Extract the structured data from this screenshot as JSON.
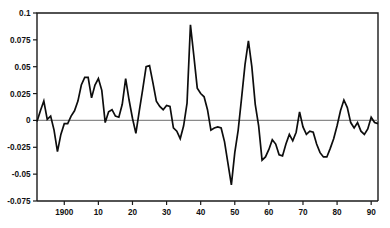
{
  "chart_data": {
    "type": "line",
    "title": "",
    "xlabel": "",
    "ylabel": "",
    "xlim": [
      1892,
      1992
    ],
    "ylim": [
      -0.075,
      0.1
    ],
    "grid": false,
    "legend": null,
    "zero_line": true,
    "y_ticks": [
      "0.1",
      "0.075",
      "0.05",
      "0.025",
      "0",
      "-0.025",
      "-0.05",
      "-0.075"
    ],
    "y_tick_values": [
      0.1,
      0.075,
      0.05,
      0.025,
      0,
      -0.025,
      -0.05,
      -0.075
    ],
    "x_ticks": [
      "1900",
      "10",
      "20",
      "30",
      "40",
      "50",
      "60",
      "70",
      "80",
      "90"
    ],
    "x_tick_values": [
      1900,
      1910,
      1920,
      1930,
      1940,
      1950,
      1960,
      1970,
      1980,
      1990
    ],
    "series": [
      {
        "name": "series-1",
        "color": "#0d0d0d",
        "x": [
          1892,
          1893,
          1894,
          1895,
          1896,
          1897,
          1898,
          1899,
          1900,
          1901,
          1902,
          1903,
          1904,
          1905,
          1906,
          1907,
          1908,
          1909,
          1910,
          1911,
          1912,
          1913,
          1914,
          1915,
          1916,
          1917,
          1918,
          1919,
          1920,
          1921,
          1922,
          1923,
          1924,
          1925,
          1926,
          1927,
          1928,
          1929,
          1930,
          1931,
          1932,
          1933,
          1934,
          1935,
          1936,
          1937,
          1938,
          1939,
          1940,
          1941,
          1942,
          1943,
          1944,
          1945,
          1946,
          1947,
          1948,
          1949,
          1950,
          1951,
          1952,
          1953,
          1954,
          1955,
          1956,
          1957,
          1958,
          1959,
          1960,
          1961,
          1962,
          1963,
          1964,
          1965,
          1966,
          1967,
          1968,
          1969,
          1970,
          1971,
          1972,
          1973,
          1974,
          1975,
          1976,
          1977,
          1978,
          1979,
          1980,
          1981,
          1982,
          1983,
          1984,
          1985,
          1986,
          1987,
          1988,
          1989,
          1990,
          1991,
          1992
        ],
        "values": [
          -0.001,
          0.009,
          0.018,
          0.001,
          0.004,
          -0.009,
          -0.029,
          -0.013,
          -0.003,
          -0.003,
          0.004,
          0.009,
          0.018,
          0.033,
          0.04,
          0.04,
          0.021,
          0.033,
          0.039,
          0.028,
          -0.002,
          0.008,
          0.01,
          0.004,
          0.003,
          0.015,
          0.039,
          0.019,
          0.002,
          -0.012,
          0.009,
          0.029,
          0.05,
          0.051,
          0.035,
          0.018,
          0.013,
          0.01,
          0.014,
          0.013,
          -0.007,
          -0.01,
          -0.017,
          -0.005,
          0.016,
          0.089,
          0.06,
          0.03,
          0.025,
          0.022,
          0.01,
          -0.009,
          -0.007,
          -0.006,
          -0.007,
          -0.02,
          -0.04,
          -0.06,
          -0.03,
          -0.009,
          0.021,
          0.052,
          0.074,
          0.05,
          0.015,
          -0.005,
          -0.037,
          -0.034,
          -0.027,
          -0.018,
          -0.022,
          -0.032,
          -0.033,
          -0.022,
          -0.013,
          -0.019,
          -0.011,
          0.008,
          -0.006,
          -0.013,
          -0.01,
          -0.011,
          -0.022,
          -0.03,
          -0.034,
          -0.034,
          -0.026,
          -0.017,
          -0.005,
          0.009,
          0.019,
          0.012,
          -0.002,
          -0.007,
          -0.002,
          -0.01,
          -0.013,
          -0.008,
          0.003,
          -0.002,
          -0.003
        ]
      }
    ]
  },
  "axes": {
    "y_label_0": "0.1",
    "y_label_1": "0.075",
    "y_label_2": "0.05",
    "y_label_3": "0.025",
    "y_label_4": "0",
    "y_label_5": "-0.025",
    "y_label_6": "-0.05",
    "y_label_7": "-0.075",
    "x_label_0": "1900",
    "x_label_1": "10",
    "x_label_2": "20",
    "x_label_3": "30",
    "x_label_4": "40",
    "x_label_5": "50",
    "x_label_6": "60",
    "x_label_7": "70",
    "x_label_8": "80",
    "x_label_9": "90"
  }
}
